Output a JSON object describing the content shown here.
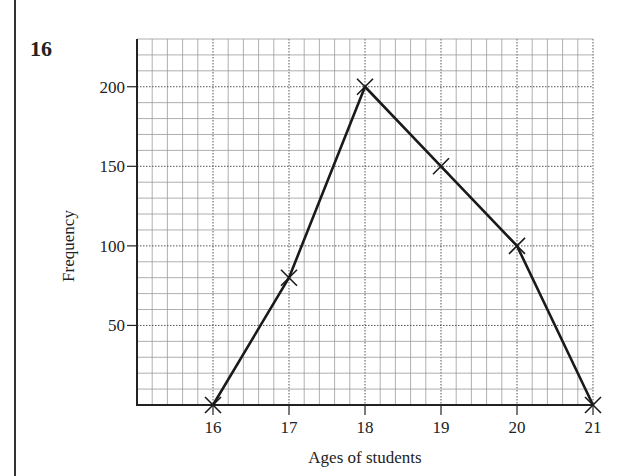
{
  "question_number": "16",
  "chart_data": {
    "type": "line",
    "title": "",
    "xlabel": "Ages of students",
    "ylabel": "Frequency",
    "x": [
      16,
      17,
      18,
      19,
      20,
      21
    ],
    "series": [
      {
        "name": "Frequency polygon",
        "values": [
          0,
          80,
          200,
          150,
          100,
          0
        ]
      }
    ],
    "x_ticks": [
      "16",
      "17",
      "18",
      "19",
      "20",
      "21"
    ],
    "y_ticks": [
      "50",
      "100",
      "150",
      "200"
    ],
    "xlim": [
      15,
      21
    ],
    "ylim": [
      0,
      230
    ],
    "grid": true,
    "minor_grid": {
      "x_step": 0.2,
      "y_step": 10
    },
    "marker": "cross",
    "legend": null
  }
}
